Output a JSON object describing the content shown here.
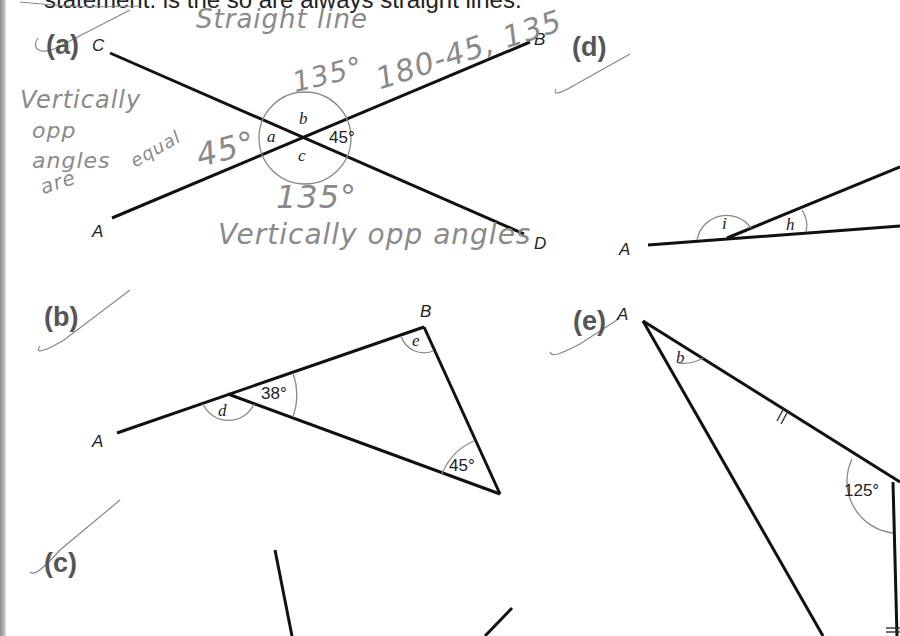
{
  "heading": "statement. is the so are always straight lines.",
  "parts": {
    "a": {
      "label": "(a)",
      "points": {
        "C": "C",
        "B": "B",
        "A": "A",
        "D": "D"
      },
      "angles": {
        "a": "a",
        "b": "b",
        "c": "c",
        "given": "45°"
      },
      "handwriting": {
        "straight_line": "Straight line",
        "b_value": "135°",
        "calc": "180-45, 135",
        "vert_1": "Vertically",
        "vert_2": "opp",
        "vert_3": "angles",
        "vert_4": "are",
        "equal": "equal",
        "a_value": "45°",
        "c_value": "135°",
        "vert_bottom": "Vertically opp angles"
      }
    },
    "b": {
      "label": "(b)",
      "points": {
        "A": "A",
        "B": "B"
      },
      "angles": {
        "d": "d",
        "e": "e",
        "given_1": "38°",
        "given_2": "45°"
      }
    },
    "c": {
      "label": "(c)"
    },
    "d": {
      "label": "(d)",
      "points": {
        "A": "A"
      },
      "angles": {
        "i": "i",
        "h": "h"
      }
    },
    "e": {
      "label": "(e)",
      "points": {
        "A": "A"
      },
      "angles": {
        "b": "b",
        "given": "125°"
      }
    }
  }
}
